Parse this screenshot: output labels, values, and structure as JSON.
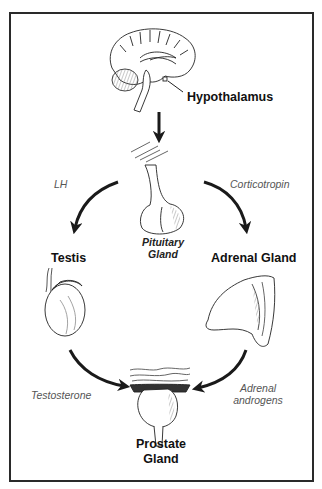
{
  "diagram": {
    "nodes": [
      {
        "id": "hypothalamus",
        "label": "Hypothalamus",
        "icon": "brain-icon"
      },
      {
        "id": "pituitary",
        "label_line1": "Pituitary",
        "label_line2": "Gland",
        "icon": "pituitary-icon"
      },
      {
        "id": "testis",
        "label": "Testis",
        "icon": "testis-icon"
      },
      {
        "id": "adrenal",
        "label": "Adrenal Gland",
        "icon": "adrenal-gland-icon"
      },
      {
        "id": "prostate",
        "label_line1": "Prostate",
        "label_line2": "Gland",
        "icon": "prostate-icon"
      }
    ],
    "edges": [
      {
        "from": "hypothalamus",
        "to": "pituitary",
        "label": ""
      },
      {
        "from": "pituitary",
        "to": "testis",
        "label": "LH"
      },
      {
        "from": "pituitary",
        "to": "adrenal",
        "label": "Corticotropin"
      },
      {
        "from": "testis",
        "to": "prostate",
        "label": "Testosterone"
      },
      {
        "from": "adrenal",
        "to": "prostate",
        "label_line1": "Adrenal",
        "label_line2": "androgens"
      }
    ],
    "colors": {
      "frame": "#2a2a2a",
      "arrow": "#1a1a1a",
      "organ_label": "#111111",
      "hormone_label": "#555555"
    }
  }
}
